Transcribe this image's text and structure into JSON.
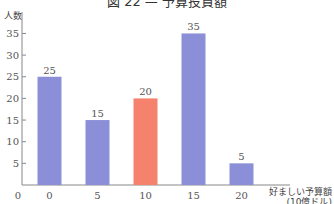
{
  "chart_data": {
    "type": "bar",
    "title": "図 22 — 予算投資額",
    "xlabel": "好ましい予算額\n(10億ドル)",
    "xlabel_line1": "好ましい予算額",
    "xlabel_line2": "(10億ドル)",
    "ylabel": "人数",
    "categories": [
      "0",
      "5",
      "10",
      "15",
      "20"
    ],
    "values": [
      25,
      15,
      20,
      35,
      5
    ],
    "highlight_index": 2,
    "colors": {
      "default": "#8b8fd8",
      "highlight": "#f5826c",
      "axis": "#888888",
      "text": "#555555"
    },
    "y_ticks": [
      5,
      10,
      15,
      20,
      25,
      30,
      35
    ],
    "origin_label": "0",
    "ylim": [
      0,
      38
    ],
    "grid": false,
    "legend": null
  }
}
